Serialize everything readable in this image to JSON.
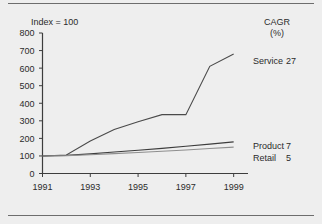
{
  "figure": {
    "background_color": "#eeeeee",
    "rule_color": "#6d6d6d",
    "axis_note": "Index = 100"
  },
  "cagr_header": {
    "line1": "CAGR",
    "line2": "(%)"
  },
  "y_axis": {
    "ticks": [
      "0",
      "100",
      "200",
      "300",
      "400",
      "500",
      "600",
      "700",
      "800"
    ],
    "values": [
      0,
      100,
      200,
      300,
      400,
      500,
      600,
      700,
      800
    ],
    "min": 0,
    "max": 800
  },
  "x_axis": {
    "ticks": [
      "1991",
      "1993",
      "1995",
      "1997",
      "1999"
    ],
    "values": [
      1991,
      1993,
      1995,
      1997,
      1999
    ],
    "min": 1991,
    "max": 1999.6
  },
  "legend": [
    {
      "label": "Service",
      "cagr": "27",
      "color": "#4a4a4a"
    },
    {
      "label": "Product",
      "cagr": "7",
      "color": "#3d3d3d"
    },
    {
      "label": "Retail",
      "cagr": "5",
      "color": "#8f8f8f"
    }
  ],
  "chart_data": {
    "type": "line",
    "title": "",
    "subtitle": "",
    "xlabel": "",
    "ylabel": "Index = 100",
    "xlim": [
      1991,
      1999.6
    ],
    "ylim": [
      0,
      800
    ],
    "grid": false,
    "legend_position": "right-inline",
    "annotations": [
      "Index = 100",
      "CAGR (%)"
    ],
    "x": [
      1991,
      1992,
      1993,
      1994,
      1995,
      1996,
      1997,
      1998,
      1999
    ],
    "series": [
      {
        "name": "Service",
        "cagr_percent": 27,
        "color": "#4a4a4a",
        "values": [
          100,
          105,
          185,
          250,
          295,
          335,
          335,
          610,
          680
        ]
      },
      {
        "name": "Product",
        "cagr_percent": 7,
        "color": "#3d3d3d",
        "values": [
          100,
          103,
          112,
          122,
          132,
          143,
          155,
          167,
          180
        ]
      },
      {
        "name": "Retail",
        "cagr_percent": 5,
        "color": "#8f8f8f",
        "values": [
          100,
          102,
          107,
          113,
          120,
          127,
          134,
          142,
          150
        ]
      }
    ]
  }
}
